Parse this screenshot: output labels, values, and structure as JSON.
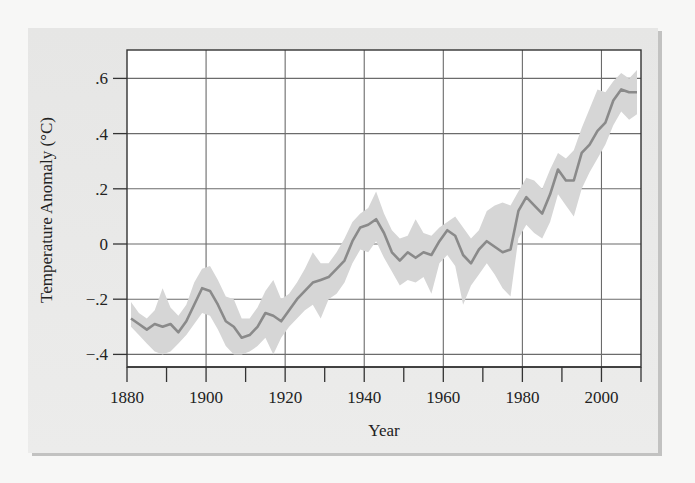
{
  "chart_data": {
    "type": "line",
    "title": "",
    "xlabel": "Year",
    "ylabel": "Temperature Anomaly (°C)",
    "xlim": [
      1880,
      2010
    ],
    "ylim": [
      -0.45,
      0.72
    ],
    "grid": true,
    "legend": "none",
    "x_ticks": [
      1880,
      1900,
      1920,
      1940,
      1960,
      1980,
      2000
    ],
    "x_tick_labels": [
      "1880",
      "1900",
      "1920",
      "1940",
      "1960",
      "1980",
      "2000"
    ],
    "x_minor_ticks": [
      1890,
      1910,
      1930,
      1950,
      1970,
      1990,
      2010
    ],
    "y_ticks": [
      0.6,
      0.4,
      0.2,
      0,
      -0.2,
      -0.4
    ],
    "y_tick_labels": [
      ".6",
      ".4",
      ".2",
      "0",
      "−.2",
      "−.4"
    ],
    "series": [
      {
        "name": "Mean temperature anomaly",
        "color": "#8a8a8a",
        "x": [
          1881,
          1883,
          1885,
          1887,
          1889,
          1891,
          1893,
          1895,
          1897,
          1899,
          1901,
          1903,
          1905,
          1907,
          1909,
          1911,
          1913,
          1915,
          1917,
          1919,
          1921,
          1923,
          1925,
          1927,
          1929,
          1931,
          1933,
          1935,
          1937,
          1939,
          1941,
          1943,
          1945,
          1947,
          1949,
          1951,
          1953,
          1955,
          1957,
          1959,
          1961,
          1963,
          1965,
          1967,
          1969,
          1971,
          1973,
          1975,
          1977,
          1979,
          1981,
          1983,
          1985,
          1987,
          1989,
          1991,
          1993,
          1995,
          1997,
          1999,
          2001,
          2003,
          2005,
          2007,
          2009
        ],
        "values": [
          -0.27,
          -0.29,
          -0.31,
          -0.29,
          -0.3,
          -0.29,
          -0.32,
          -0.28,
          -0.22,
          -0.16,
          -0.17,
          -0.22,
          -0.28,
          -0.3,
          -0.34,
          -0.33,
          -0.3,
          -0.25,
          -0.26,
          -0.28,
          -0.24,
          -0.2,
          -0.17,
          -0.14,
          -0.13,
          -0.12,
          -0.09,
          -0.06,
          0.01,
          0.06,
          0.07,
          0.09,
          0.04,
          -0.03,
          -0.06,
          -0.03,
          -0.05,
          -0.03,
          -0.04,
          0.01,
          0.05,
          0.03,
          -0.04,
          -0.07,
          -0.02,
          0.01,
          -0.01,
          -0.03,
          -0.02,
          0.12,
          0.17,
          0.14,
          0.11,
          0.18,
          0.27,
          0.23,
          0.23,
          0.33,
          0.36,
          0.41,
          0.44,
          0.52,
          0.56,
          0.55,
          0.55
        ]
      },
      {
        "name": "Uncertainty band lower",
        "color": "#d9d9d9",
        "x": [
          1881,
          1883,
          1885,
          1887,
          1889,
          1891,
          1893,
          1895,
          1897,
          1899,
          1901,
          1903,
          1905,
          1907,
          1909,
          1911,
          1913,
          1915,
          1917,
          1919,
          1921,
          1923,
          1925,
          1927,
          1929,
          1931,
          1933,
          1935,
          1937,
          1939,
          1941,
          1943,
          1945,
          1947,
          1949,
          1951,
          1953,
          1955,
          1957,
          1959,
          1961,
          1963,
          1965,
          1967,
          1969,
          1971,
          1973,
          1975,
          1977,
          1979,
          1981,
          1983,
          1985,
          1987,
          1989,
          1991,
          1993,
          1995,
          1997,
          1999,
          2001,
          2003,
          2005,
          2007,
          2009
        ],
        "values": [
          -0.3,
          -0.33,
          -0.36,
          -0.39,
          -0.4,
          -0.39,
          -0.36,
          -0.33,
          -0.29,
          -0.25,
          -0.26,
          -0.31,
          -0.37,
          -0.4,
          -0.4,
          -0.39,
          -0.37,
          -0.34,
          -0.4,
          -0.34,
          -0.3,
          -0.27,
          -0.24,
          -0.22,
          -0.27,
          -0.2,
          -0.18,
          -0.14,
          -0.07,
          -0.02,
          -0.03,
          0.01,
          -0.05,
          -0.1,
          -0.15,
          -0.13,
          -0.14,
          -0.12,
          -0.18,
          -0.07,
          -0.04,
          -0.08,
          -0.22,
          -0.15,
          -0.11,
          -0.07,
          -0.11,
          -0.16,
          -0.19,
          0.02,
          0.07,
          0.04,
          0.02,
          0.08,
          0.18,
          0.14,
          0.1,
          0.2,
          0.26,
          0.31,
          0.36,
          0.43,
          0.48,
          0.45,
          0.47
        ]
      },
      {
        "name": "Uncertainty band upper",
        "color": "#d9d9d9",
        "x": [
          1881,
          1883,
          1885,
          1887,
          1889,
          1891,
          1893,
          1895,
          1897,
          1899,
          1901,
          1903,
          1905,
          1907,
          1909,
          1911,
          1913,
          1915,
          1917,
          1919,
          1921,
          1923,
          1925,
          1927,
          1929,
          1931,
          1933,
          1935,
          1937,
          1939,
          1941,
          1943,
          1945,
          1947,
          1949,
          1951,
          1953,
          1955,
          1957,
          1959,
          1961,
          1963,
          1965,
          1967,
          1969,
          1971,
          1973,
          1975,
          1977,
          1979,
          1981,
          1983,
          1985,
          1987,
          1989,
          1991,
          1993,
          1995,
          1997,
          1999,
          2001,
          2003,
          2005,
          2007,
          2009
        ],
        "values": [
          -0.21,
          -0.25,
          -0.27,
          -0.24,
          -0.16,
          -0.23,
          -0.26,
          -0.22,
          -0.14,
          -0.09,
          -0.08,
          -0.13,
          -0.19,
          -0.2,
          -0.27,
          -0.27,
          -0.23,
          -0.17,
          -0.13,
          -0.2,
          -0.18,
          -0.14,
          -0.09,
          -0.03,
          -0.07,
          -0.07,
          -0.03,
          0.02,
          0.08,
          0.11,
          0.13,
          0.19,
          0.11,
          0.05,
          0.02,
          0.03,
          0.09,
          0.04,
          0.03,
          0.06,
          0.08,
          0.1,
          0.06,
          0.02,
          0.05,
          0.12,
          0.14,
          0.15,
          0.14,
          0.19,
          0.24,
          0.23,
          0.2,
          0.27,
          0.33,
          0.31,
          0.34,
          0.42,
          0.49,
          0.56,
          0.55,
          0.59,
          0.62,
          0.6,
          0.63
        ]
      }
    ]
  }
}
